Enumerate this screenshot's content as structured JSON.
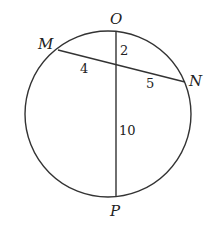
{
  "diagram": {
    "circle": {
      "cx": 108,
      "cy": 114,
      "r": 83,
      "stroke": "#333333"
    },
    "points": {
      "O": {
        "label": "O",
        "x": 116,
        "y": 31
      },
      "M": {
        "label": "M",
        "x": 58,
        "y": 50
      },
      "N": {
        "label": "N",
        "x": 185,
        "y": 82
      },
      "P": {
        "label": "P",
        "x": 116,
        "y": 197
      }
    },
    "chords": [
      {
        "from": "M",
        "to": "N"
      },
      {
        "from": "O",
        "to": "P"
      }
    ],
    "segment_labels": {
      "OX": "2",
      "MX": "4",
      "XN": "5",
      "XP": "10"
    }
  }
}
